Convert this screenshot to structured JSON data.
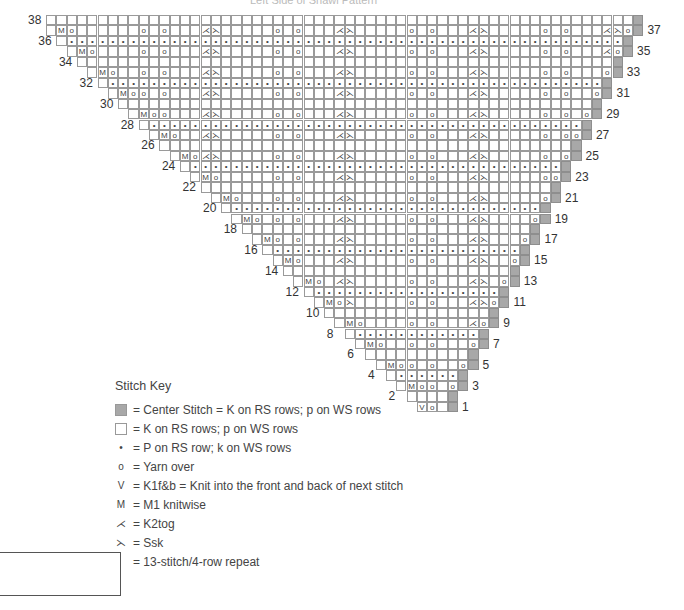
{
  "title": "Left Side of Shawl Pattern",
  "chart": {
    "rows": 38,
    "symbols": {
      "knit": "",
      "purl": "•",
      "yo": "o",
      "kfb": "V",
      "m1": "M",
      "k2tog": "⋌",
      "ssk": "⋋"
    },
    "odd_row_labels_right": [
      1,
      3,
      5,
      7,
      9,
      11,
      13,
      15,
      17,
      19,
      21,
      23,
      25,
      27,
      29,
      31,
      33,
      35,
      37
    ],
    "even_row_labels_left": [
      2,
      4,
      6,
      8,
      10,
      12,
      14,
      16,
      18,
      20,
      22,
      24,
      26,
      28,
      30,
      32,
      34,
      36,
      38
    ]
  },
  "key": {
    "title": "Stitch Key",
    "items": [
      {
        "symbol": "gray-square",
        "label": "= Center Stitch = K on RS rows; p on WS rows"
      },
      {
        "symbol": "white-square",
        "label": "= K on RS rows; p on WS rows"
      },
      {
        "symbol": "•",
        "label": "= P on RS row; k on WS rows"
      },
      {
        "symbol": "o",
        "label": "= Yarn over"
      },
      {
        "symbol": "V",
        "label": "= K1f&b = Knit into the front and back of next stitch"
      },
      {
        "symbol": "M",
        "label": "= M1 knitwise"
      },
      {
        "symbol": "⋌",
        "label": "= K2tog"
      },
      {
        "symbol": "⋋",
        "label": "= Ssk"
      }
    ],
    "repeat_label": "= 13-stitch/4-row repeat"
  }
}
